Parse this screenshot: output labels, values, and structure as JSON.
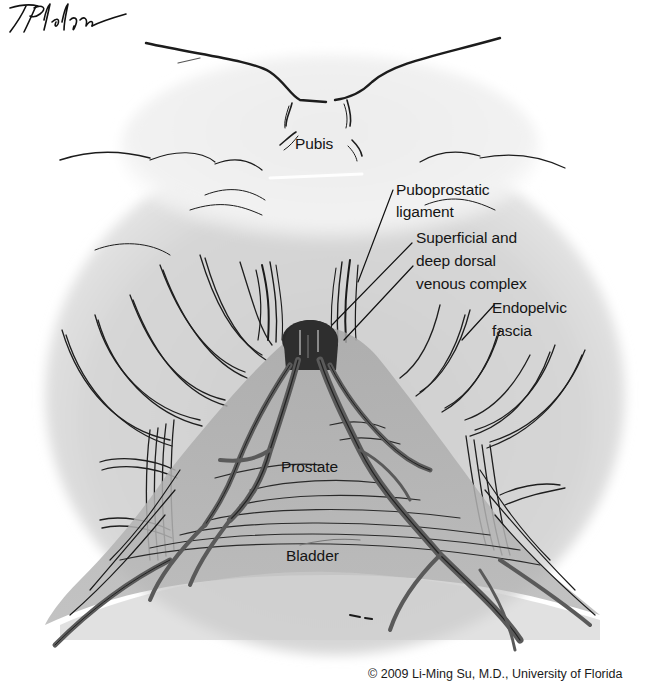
{
  "figure": {
    "colors": {
      "background": "#ffffff",
      "tissue_shade": "#d4d4d4",
      "tissue_dark": "#9a9a9a",
      "vessel": "#6e6e6e",
      "ink": "#1a1a1a"
    }
  },
  "labels": {
    "pubis": "Pubis",
    "puboprostatic_ligament": [
      "Puboprostatic",
      "ligament"
    ],
    "dorsal_venous_complex": [
      "Superficial and",
      "deep dorsal",
      "venous complex"
    ],
    "endopelvic_fascia": [
      "Endopelvic",
      "fascia"
    ],
    "prostate": "Prostate",
    "bladder": "Bladder"
  },
  "signature": "T Phelps",
  "copyright": "© 2009 Li-Ming Su, M.D., University of Florida"
}
